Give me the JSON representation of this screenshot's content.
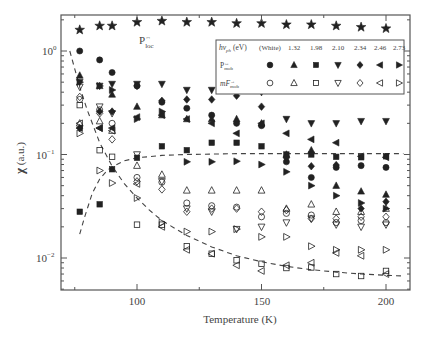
{
  "chart_data": {
    "type": "scatter",
    "title": "",
    "xlabel": "Temperature (K)",
    "ylabel": "χ (a.u.)",
    "xscale": "linear",
    "yscale": "log",
    "xlim": [
      69.5,
      209.5
    ],
    "ylim": [
      0.005,
      2.3
    ],
    "xticks": [
      100,
      150,
      200
    ],
    "xtick_labels": [
      "100",
      "150",
      "200"
    ],
    "yticks": [
      0.01,
      0.1,
      1
    ],
    "ytick_labels": [
      "10^-2",
      "10^-1",
      "10^0"
    ],
    "grid": false,
    "legend": {
      "position": "upper right (inside)",
      "header": [
        "hν_ph (eV)",
        "(White)",
        "1.32",
        "1.98",
        "2.10",
        "2.34",
        "2.46",
        "2.73"
      ],
      "row_labels": [
        "P↔mob",
        "mF→mob"
      ],
      "filled_markers": [
        "circle",
        "triangle-up",
        "square",
        "triangle-down",
        "diamond",
        "triangle-left",
        "triangle-right"
      ],
      "open_markers": [
        "circle",
        "triangle-up",
        "square",
        "triangle-down",
        "diamond",
        "triangle-left",
        "triangle-right"
      ]
    },
    "annotations": [
      {
        "text": "P↔loc",
        "x": 106,
        "y": 1.45
      }
    ],
    "x": [
      77,
      85,
      90,
      100,
      110,
      120,
      130,
      140,
      150,
      160,
      170,
      180,
      190,
      200
    ],
    "series": [
      {
        "name": "P↔loc",
        "marker": "star",
        "filled": true,
        "values": [
          1.6,
          1.75,
          1.75,
          1.9,
          1.95,
          1.9,
          1.9,
          1.85,
          1.85,
          1.8,
          1.8,
          1.75,
          1.7,
          1.65
        ]
      },
      {
        "name": "P↔mob (White)",
        "marker": "circle",
        "filled": true,
        "values": [
          1.0,
          0.82,
          0.62,
          0.46,
          0.32,
          0.28,
          0.24,
          0.2,
          0.19,
          0.085,
          0.06,
          0.075,
          0.078,
          0.075
        ]
      },
      {
        "name": "P↔mob 1.32 eV",
        "marker": "triangle-up",
        "filled": true,
        "values": [
          0.58,
          0.46,
          0.38,
          0.29,
          0.24,
          0.22,
          0.22,
          0.22,
          0.2,
          0.1,
          0.11,
          0.05,
          0.044,
          0.041
        ]
      },
      {
        "name": "P↔mob 1.98 eV",
        "marker": "square",
        "filled": true,
        "values": [
          0.028,
          0.033,
          0.072,
          0.093,
          0.12,
          0.11,
          0.13,
          0.13,
          0.12,
          0.1,
          0.1,
          0.095,
          0.094,
          0.096
        ]
      },
      {
        "name": "P↔mob 2.10 eV",
        "marker": "triangle-down",
        "filled": true,
        "values": [
          0.5,
          0.46,
          0.48,
          0.48,
          0.48,
          0.42,
          0.42,
          0.48,
          0.4,
          0.22,
          0.2,
          0.2,
          0.21,
          0.21
        ]
      },
      {
        "name": "P↔mob 2.34 eV",
        "marker": "diamond",
        "filled": true,
        "values": [
          0.18,
          0.26,
          0.26,
          0.46,
          0.33,
          0.34,
          0.34,
          0.37,
          0.29,
          0.093,
          0.077,
          0.079,
          0.03,
          0.035
        ]
      },
      {
        "name": "P↔mob 2.46 eV",
        "marker": "triangle-left",
        "filled": true,
        "values": [
          0.18,
          0.18,
          0.18,
          0.23,
          0.24,
          0.22,
          0.2,
          0.16,
          0.2,
          0.16,
          0.14,
          0.13,
          0.096,
          0.094
        ]
      },
      {
        "name": "P↔mob 2.73 eV",
        "marker": "triangle-right",
        "filled": true,
        "values": [
          0.5,
          0.46,
          0.42,
          0.22,
          0.26,
          0.085,
          0.085,
          0.086,
          0.08,
          0.068,
          0.05,
          0.04,
          0.034,
          0.03
        ]
      },
      {
        "name": "mF→mob (White)",
        "marker": "circle",
        "filled": false,
        "values": [
          0.34,
          0.27,
          0.2,
          0.06,
          0.054,
          0.034,
          0.032,
          0.031,
          0.025,
          0.027,
          0.026,
          0.022,
          0.023,
          0.022
        ]
      },
      {
        "name": "mF→mob 1.32 eV",
        "marker": "triangle-up",
        "filled": false,
        "values": [
          0.2,
          0.21,
          0.17,
          0.078,
          0.064,
          0.045,
          0.045,
          0.045,
          0.045,
          0.03,
          0.033,
          0.028,
          0.028,
          0.03
        ]
      },
      {
        "name": "mF→mob 1.98 eV",
        "marker": "square",
        "filled": false,
        "values": [
          0.3,
          0.11,
          0.095,
          0.021,
          0.021,
          0.013,
          0.011,
          0.0095,
          0.0088,
          0.008,
          0.0081,
          0.007,
          0.0067,
          0.0075
        ]
      },
      {
        "name": "mF→mob 2.10 eV",
        "marker": "triangle-down",
        "filled": false,
        "values": [
          0.45,
          0.29,
          0.25,
          0.1,
          0.055,
          0.03,
          0.028,
          0.019,
          0.02,
          0.022,
          0.024,
          0.021,
          0.02,
          0.021
        ]
      },
      {
        "name": "mF→mob 2.34 eV",
        "marker": "diamond",
        "filled": false,
        "values": [
          0.36,
          0.25,
          0.14,
          0.055,
          0.046,
          0.028,
          0.03,
          0.03,
          0.028,
          0.029,
          0.024,
          0.024,
          0.025,
          0.025
        ]
      },
      {
        "name": "mF→mob 2.46 eV",
        "marker": "triangle-left",
        "filled": false,
        "values": [
          0.2,
          0.18,
          0.17,
          0.052,
          0.02,
          0.012,
          0.011,
          0.0085,
          0.0075,
          0.0085,
          0.009,
          0.0112,
          0.0105,
          0.007
        ]
      },
      {
        "name": "mF→mob 2.73 eV",
        "marker": "triangle-right",
        "filled": false,
        "values": [
          0.16,
          0.07,
          0.053,
          0.038,
          0.022,
          0.018,
          0.018,
          0.019,
          0.016,
          0.016,
          0.013,
          0.012,
          0.012,
          0.012
        ]
      }
    ],
    "fit_curves": [
      {
        "name": "decay fit",
        "style": "dashed",
        "x": [
          73,
          77,
          80,
          85,
          90,
          95,
          100,
          105,
          110,
          120,
          130,
          140,
          150,
          160,
          170,
          180,
          190,
          200,
          207
        ],
        "values": [
          1.0,
          0.45,
          0.27,
          0.13,
          0.077,
          0.052,
          0.038,
          0.029,
          0.023,
          0.0165,
          0.0128,
          0.0105,
          0.0092,
          0.0083,
          0.0077,
          0.0073,
          0.007,
          0.0068,
          0.0067
        ]
      },
      {
        "name": "rise fit",
        "style": "dashed",
        "x": [
          77,
          79,
          82,
          85,
          88,
          90,
          95,
          100,
          110,
          120,
          130,
          140,
          150,
          160,
          170,
          180,
          190,
          200,
          207
        ],
        "values": [
          0.017,
          0.025,
          0.042,
          0.058,
          0.07,
          0.076,
          0.087,
          0.093,
          0.098,
          0.1,
          0.101,
          0.102,
          0.102,
          0.102,
          0.102,
          0.102,
          0.102,
          0.102,
          0.102
        ]
      }
    ]
  },
  "labels": {
    "xlabel": "Temperature (K)",
    "ylabel_chi": "χ",
    "ylabel_unit": " (a.u.)",
    "ploc_main": "P",
    "ploc_sup": "↔",
    "ploc_sub": "loc",
    "legend_hv": "hν",
    "legend_hv_sub": "ph",
    "legend_hv_unit": " (eV)",
    "legend_cols": [
      "(White)",
      "1.32",
      "1.98",
      "2.10",
      "2.34",
      "2.46",
      "2.73"
    ],
    "legend_row1_main": "P",
    "legend_row1_sup": "↔",
    "legend_row1_sub": "mob",
    "legend_row2_main": "mF",
    "legend_row2_sup": "→",
    "legend_row2_sub": "mob",
    "xtick_100": "100",
    "xtick_150": "150",
    "xtick_200": "200",
    "ytick_base": "10",
    "ytick_exp_0": "0",
    "ytick_exp_1": "−1",
    "ytick_exp_2": "−2"
  },
  "colors": {
    "marker": "#222222",
    "axis": "#555555",
    "text": "#444444",
    "background": "#ffffff"
  }
}
